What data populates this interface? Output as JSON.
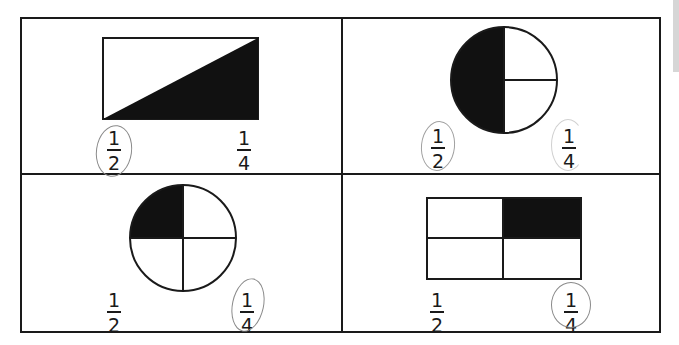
{
  "worksheet": {
    "instructions": "Circle the fraction that names the shaded part.",
    "problems": [
      {
        "id": "p1",
        "shape": "rectangle",
        "division": "diagonal",
        "shaded": "lower-right triangle",
        "choices": [
          "1/2",
          "1/4"
        ],
        "circled": "1/2",
        "choice_a": {
          "num": "1",
          "den": "2"
        },
        "choice_b": {
          "num": "1",
          "den": "4"
        }
      },
      {
        "id": "p2",
        "shape": "circle",
        "division": "half + two quarters",
        "shaded": "left half",
        "choices": [
          "1/2",
          "1/4"
        ],
        "circled": "1/2 (and faint circle on 1/4)",
        "choice_a": {
          "num": "1",
          "den": "2"
        },
        "choice_b": {
          "num": "1",
          "den": "4"
        }
      },
      {
        "id": "p3",
        "shape": "circle",
        "division": "quarters",
        "shaded": "top-left quarter",
        "choices": [
          "1/2",
          "1/4"
        ],
        "circled": "1/4",
        "choice_a": {
          "num": "1",
          "den": "2"
        },
        "choice_b": {
          "num": "1",
          "den": "4"
        }
      },
      {
        "id": "p4",
        "shape": "rectangle",
        "division": "2x2 quarters",
        "shaded": "top-right quarter",
        "choices": [
          "1/2",
          "1/4"
        ],
        "circled": "1/4",
        "choice_a": {
          "num": "1",
          "den": "2"
        },
        "choice_b": {
          "num": "1",
          "den": "4"
        }
      }
    ]
  },
  "colors": {
    "ink": "#1a1a1a",
    "pencil": "#8a8a8a",
    "paper": "#ffffff",
    "tab": "#d6d6d6"
  }
}
